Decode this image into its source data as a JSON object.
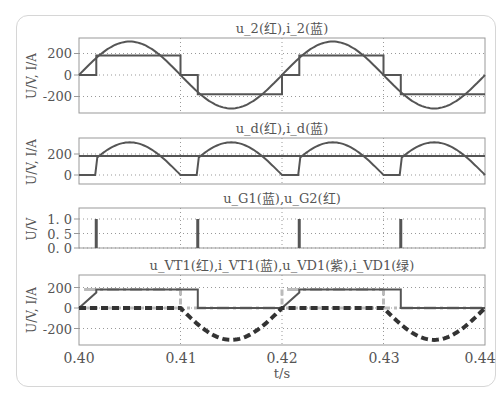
{
  "figure": {
    "xlabel": "t/s",
    "x_ticks": [
      "0.40",
      "0.41",
      "0.42",
      "0.43",
      "0.44"
    ],
    "colors": {
      "trace_dark": "#555555",
      "trace_light": "#bbbbbb",
      "grid": "#999999",
      "frame": "#999999"
    }
  },
  "chart_data": [
    {
      "type": "line",
      "title": "u_2(红),i_2(蓝)",
      "xlabel": "t/s",
      "ylabel": "U/V, I/A",
      "xlim": [
        0.4,
        0.44
      ],
      "ylim": [
        -320,
        330
      ],
      "y_ticks": [
        "200",
        "0",
        "-200"
      ],
      "grid": true,
      "series": [
        {
          "name": "u_2 (红)",
          "shape": "sine",
          "amplitude": 311,
          "period": 0.02,
          "phase_start": 0.4
        },
        {
          "name": "i_2 (蓝)",
          "shape": "stepped square wave",
          "x": [
            0.4,
            0.4017,
            0.4017,
            0.41,
            0.41,
            0.4117,
            0.4117,
            0.42,
            0.42,
            0.4217,
            0.4217,
            0.43,
            0.43,
            0.4317,
            0.4317,
            0.44
          ],
          "values": [
            0,
            0,
            180,
            180,
            0,
            0,
            -180,
            -180,
            0,
            0,
            180,
            180,
            0,
            0,
            -180,
            -180
          ]
        }
      ]
    },
    {
      "type": "line",
      "title": "u_d(红),i_d(蓝)",
      "xlabel": "t/s",
      "ylabel": "U/V, I/A",
      "xlim": [
        0.4,
        0.44
      ],
      "ylim": [
        -30,
        330
      ],
      "y_ticks": [
        "200",
        "0"
      ],
      "grid": true,
      "series": [
        {
          "name": "u_d (红)",
          "shape": "controlled rectified sine (alpha=30deg)",
          "peak": 311,
          "zero_intervals": [
            [
              0.4,
              0.4017
            ],
            [
              0.41,
              0.4117
            ],
            [
              0.42,
              0.4217
            ],
            [
              0.43,
              0.4317
            ]
          ]
        },
        {
          "name": "i_d (蓝)",
          "shape": "constant",
          "values": [
            180
          ]
        }
      ]
    },
    {
      "type": "line",
      "title": "u_G1(蓝),u_G2(红)",
      "xlabel": "t/s",
      "ylabel": "U/V",
      "xlim": [
        0.4,
        0.44
      ],
      "ylim": [
        0,
        1.2
      ],
      "y_ticks": [
        "1. 0",
        "0. 5",
        "0. 0"
      ],
      "grid": true,
      "series": [
        {
          "name": "u_G1 (蓝)",
          "pulses_at": [
            0.4017,
            0.4217
          ],
          "amplitude": 1.0
        },
        {
          "name": "u_G2 (红)",
          "pulses_at": [
            0.4117,
            0.4317
          ],
          "amplitude": 1.0
        }
      ]
    },
    {
      "type": "line",
      "title": "u_VT1(红),i_VT1(蓝),u_VD1(紫),i_VD1(绿)",
      "xlabel": "t/s",
      "ylabel": "U/V, I/A",
      "xlim": [
        0.4,
        0.44
      ],
      "ylim": [
        -320,
        270
      ],
      "y_ticks": [
        "200",
        "0",
        "-200"
      ],
      "grid": true,
      "series": [
        {
          "name": "u_VT1 (红)",
          "shape": "0 while conducting, follows negative sine half-cycle",
          "min": -311
        },
        {
          "name": "i_VT1 (蓝)",
          "x": [
            0.4,
            0.4017,
            0.4017,
            0.4117,
            0.4117,
            0.42,
            0.4217,
            0.4217,
            0.4317,
            0.4317,
            0.44
          ],
          "values": [
            0,
            150,
            180,
            180,
            0,
            0,
            150,
            180,
            180,
            0,
            0
          ]
        },
        {
          "name": "u_VD1 (紫)",
          "shape": "dashed, 0 then negative half-sine",
          "min": -311
        },
        {
          "name": "i_VD1 (绿)",
          "shape": "light dash-dot",
          "values_level": [
            180,
            0
          ]
        }
      ]
    }
  ]
}
